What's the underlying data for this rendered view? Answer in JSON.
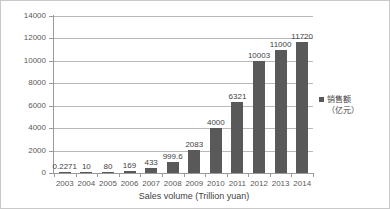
{
  "chart_data": {
    "type": "bar",
    "title": "",
    "xlabel": "Sales volume (Trillion yuan)",
    "ylabel": "",
    "ylim": [
      0,
      14000
    ],
    "ytick_interval": 2000,
    "yticks": [
      "0",
      "2000",
      "4000",
      "6000",
      "8000",
      "10000",
      "12000",
      "14000"
    ],
    "grid": true,
    "legend_position": "right",
    "categories": [
      "2003",
      "2004",
      "2005",
      "2006",
      "2007",
      "2008",
      "2009",
      "2010",
      "2011",
      "2012",
      "2013",
      "2014"
    ],
    "values": [
      0.2271,
      10,
      80,
      169,
      433,
      999.6,
      2083,
      4000,
      6321,
      10003,
      11000,
      11720
    ],
    "value_labels": [
      "0.2271",
      "10",
      "80",
      "169",
      "433",
      "999.6",
      "2083",
      "4000",
      "6321",
      "10003",
      "11000",
      "11720"
    ],
    "series": [
      {
        "name": "销售额（亿元）",
        "values": [
          0.2271,
          10,
          80,
          169,
          433,
          999.6,
          2083,
          4000,
          6321,
          10003,
          11000,
          11720
        ]
      }
    ],
    "legend": {
      "name": "销售额",
      "unit": "（亿元）"
    },
    "colors": {
      "bar": "#595959",
      "grid": "#b9b9b9",
      "axis": "#9a9a9a",
      "text": "#595959",
      "label_text": "#3f3f3f",
      "background": "#ffffff",
      "border": "#c9c9c9"
    }
  }
}
